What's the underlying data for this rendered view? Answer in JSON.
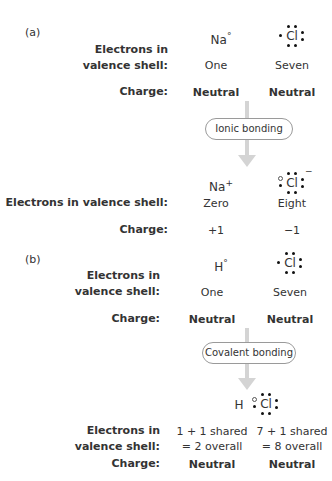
{
  "caption_cut": "",
  "panel_a": {
    "label": "(a)",
    "atoms": [
      {
        "symbol": "Na",
        "superscript": "°"
      },
      {
        "symbol": "Cl",
        "superscript": ""
      }
    ],
    "row_labels": {
      "electrons": [
        "Electrons in",
        "valence shell:"
      ],
      "charge": "Charge:"
    },
    "electrons": [
      "One",
      "Seven"
    ],
    "charge": [
      "Neutral",
      "Neutral"
    ],
    "process": "Ionic bonding",
    "products": [
      {
        "symbol": "Na",
        "superscript": "+"
      },
      {
        "symbol": "Cl",
        "superscript": "−"
      }
    ],
    "product_row_labels": {
      "electrons": "Electrons in valence shell:",
      "charge": "Charge:"
    },
    "product_electrons": [
      "Zero",
      "Eight"
    ],
    "product_charge": [
      "+1",
      "−1"
    ]
  },
  "panel_b": {
    "label": "(b)",
    "atoms": [
      {
        "symbol": "H",
        "superscript": "°"
      },
      {
        "symbol": "Cl",
        "superscript": ""
      }
    ],
    "row_labels": {
      "electrons": [
        "Electrons in",
        "valence shell:"
      ],
      "charge": "Charge:"
    },
    "electrons": [
      "One",
      "Seven"
    ],
    "charge": [
      "Neutral",
      "Neutral"
    ],
    "process": "Covalent bonding",
    "product_formula": {
      "h": "H",
      "cl": "Cl"
    },
    "product_row_labels": {
      "electrons": [
        "Electrons in",
        "valence shell:"
      ],
      "charge": "Charge:"
    },
    "product_electrons": [
      [
        "1 + 1 shared",
        "= 2 overall"
      ],
      [
        "7 + 1 shared",
        "= 8 overall"
      ]
    ],
    "product_charge": [
      "Neutral",
      "Neutral"
    ]
  }
}
